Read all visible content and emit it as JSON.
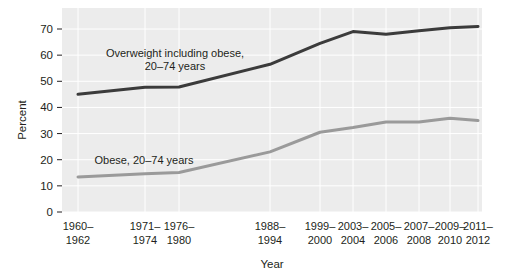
{
  "chart_data": {
    "type": "line",
    "title": "",
    "xlabel": "Year",
    "ylabel": "Percent",
    "ylim": [
      0,
      75
    ],
    "yticks": [
      0,
      10,
      20,
      30,
      40,
      50,
      60,
      70
    ],
    "ytick_labels": [
      "0",
      "10",
      "20",
      "30",
      "40",
      "50",
      "60",
      "70"
    ],
    "grid": true,
    "legend_position": "inline-annotation",
    "categories": [
      "1960–1962",
      "1971–1974",
      "1976–1980",
      "1988–1994",
      "1999–2000",
      "2003–2004",
      "2005–2006",
      "2007–2008",
      "2009–2010",
      "2011–2012"
    ],
    "category_lines": [
      [
        "1960–",
        "1962"
      ],
      [
        "1971–",
        "1974"
      ],
      [
        "1976–",
        "1980"
      ],
      [
        "1988–",
        "1994"
      ],
      [
        "1999–",
        "2000"
      ],
      [
        "2003–",
        "2004"
      ],
      [
        "2005–",
        "2006"
      ],
      [
        "2007–",
        "2008"
      ],
      [
        "2009–",
        "2010"
      ],
      [
        "2011–",
        "2012"
      ]
    ],
    "x_positions": [
      78,
      145,
      179,
      270,
      320,
      353,
      386,
      419,
      450,
      478
    ],
    "series": [
      {
        "name": "Overweight including obese, 20–74 years",
        "color": "#3b3b3b",
        "width": 3,
        "values": [
          45.0,
          47.7,
          47.8,
          56.5,
          64.5,
          69.0,
          68.0,
          69.3,
          70.5,
          71.0
        ],
        "label_lines": [
          "Overweight including obese,",
          "20–74 years"
        ],
        "label_x": 175,
        "label_y": 57
      },
      {
        "name": "Obese, 20–74 years",
        "color": "#9a9a9a",
        "width": 3,
        "values": [
          13.4,
          14.6,
          15.1,
          23.0,
          30.5,
          32.3,
          34.4,
          34.4,
          35.9,
          35.0
        ],
        "label_lines": [
          "Obese, 20–74 years"
        ],
        "label_x": 144,
        "label_y": 164
      }
    ]
  },
  "plot_area": {
    "left": 62,
    "right": 482,
    "top": 8,
    "bottom": 212,
    "background_color": "#ececec",
    "gridline_color": "#ffffff",
    "border_color": "#d0d0d0"
  }
}
